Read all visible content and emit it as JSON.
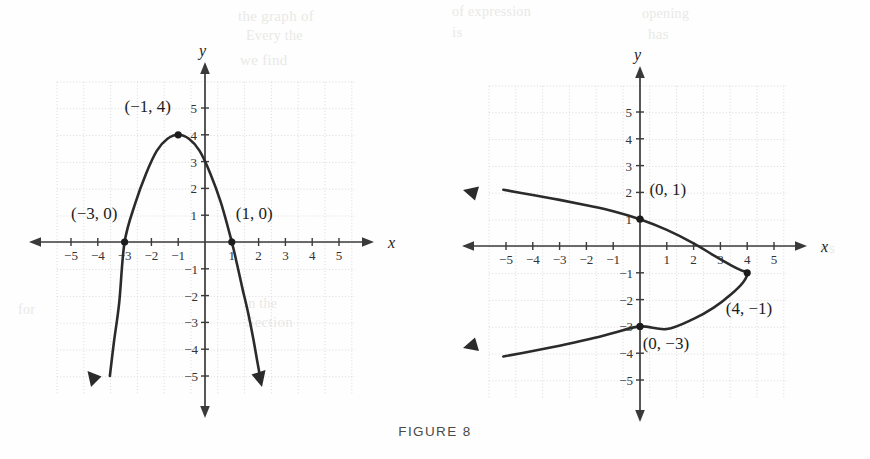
{
  "caption": "FIGURE 8",
  "ghost_text": [
    {
      "text": "the graph of",
      "x": 238,
      "y": 8
    },
    {
      "text": "Every the",
      "x": 246,
      "y": 28
    },
    {
      "text": "we find",
      "x": 240,
      "y": 52
    },
    {
      "text": "in the",
      "x": 244,
      "y": 296
    },
    {
      "text": "Section",
      "x": 246,
      "y": 314
    },
    {
      "text": "of expression",
      "x": 452,
      "y": 4
    },
    {
      "text": "is",
      "x": 452,
      "y": 24
    },
    {
      "text": "opening",
      "x": 642,
      "y": 6
    },
    {
      "text": "has",
      "x": 648,
      "y": 26
    },
    {
      "text": "for",
      "x": 18,
      "y": 302
    },
    {
      "text": "its",
      "x": 820,
      "y": 240
    }
  ],
  "axis_label_x": "x",
  "axis_label_y": "y",
  "colors": {
    "curve": "#2b2b2b",
    "axis": "#3a3a3a",
    "grid": "#d9d9d9",
    "tick_text": "#333333",
    "point": "#1c1c1c",
    "caption": "#4a4a4a",
    "background": "#fefefe"
  },
  "chart_data": [
    {
      "type": "line",
      "name": "left-parabola",
      "title": "",
      "xlabel": "x",
      "ylabel": "y",
      "xlim": [
        -6,
        6
      ],
      "ylim": [
        -6,
        6
      ],
      "xticks": [
        -5,
        -4,
        -3,
        -2,
        -1,
        1,
        2,
        3,
        4,
        5
      ],
      "xtick_labels": [
        "−5",
        "−4",
        "−3",
        "−2",
        "−1",
        "1",
        "2",
        "3",
        "4",
        "5"
      ],
      "yticks": [
        5,
        4,
        3,
        2,
        1,
        -1,
        -2,
        -3,
        -4,
        -5
      ],
      "ytick_labels": [
        "5",
        "4",
        "3",
        "2",
        "1",
        "−1",
        "−2",
        "−3",
        "−4",
        "−5"
      ],
      "grid": true,
      "legend": "none",
      "equation": "y = -(x+1)^2 + 4",
      "orientation": "opens-down",
      "vertex": [
        -1,
        4
      ],
      "x_intercepts": [
        [
          -3,
          0
        ],
        [
          1,
          0
        ]
      ],
      "annotations": [
        {
          "label": "(−1, 4)",
          "point": [
            -1,
            4
          ],
          "label_x": -3.0,
          "label_y": 4.85
        },
        {
          "label": "(−3, 0)",
          "point": [
            -3,
            0
          ],
          "label_x": -5.0,
          "label_y": 0.85
        },
        {
          "label": "(1, 0)",
          "point": [
            1,
            0
          ],
          "label_x": 1.15,
          "label_y": 0.85
        }
      ],
      "curve_points": [
        [
          -3.55,
          -5.0
        ],
        [
          -3.4,
          -3.75
        ],
        [
          -3.2,
          -2.25
        ],
        [
          -3.0,
          0.0
        ],
        [
          -2.6,
          1.45
        ],
        [
          -2.2,
          2.55
        ],
        [
          -1.8,
          3.4
        ],
        [
          -1.4,
          3.85
        ],
        [
          -1.0,
          4.0
        ],
        [
          -0.6,
          3.85
        ],
        [
          -0.2,
          3.4
        ],
        [
          0.2,
          2.55
        ],
        [
          0.6,
          1.45
        ],
        [
          1.0,
          0.0
        ],
        [
          1.2,
          -0.85
        ],
        [
          1.4,
          -1.75
        ],
        [
          1.6,
          -2.6
        ],
        [
          1.8,
          -3.6
        ],
        [
          1.95,
          -4.45
        ],
        [
          2.05,
          -5.0
        ]
      ]
    },
    {
      "type": "line",
      "name": "right-parabola",
      "title": "",
      "xlabel": "x",
      "ylabel": "y",
      "xlim": [
        -6,
        6
      ],
      "ylim": [
        -6,
        6
      ],
      "xticks": [
        -5,
        -4,
        -3,
        -2,
        -1,
        1,
        2,
        3,
        4,
        5
      ],
      "xtick_labels": [
        "−5",
        "−4",
        "−3",
        "−2",
        "−1",
        "1",
        "2",
        "3",
        "4",
        "5"
      ],
      "yticks": [
        5,
        4,
        3,
        2,
        1,
        -1,
        -2,
        -3,
        -4,
        -5
      ],
      "ytick_labels": [
        "5",
        "4",
        "3",
        "2",
        "1",
        "−1",
        "−2",
        "−3",
        "−4",
        "−5"
      ],
      "grid": true,
      "legend": "none",
      "equation": "x = -(y+1)^2 + 4",
      "orientation": "opens-left",
      "vertex": [
        4,
        -1
      ],
      "y_intercepts": [
        [
          0,
          1
        ],
        [
          0,
          -3
        ]
      ],
      "annotations": [
        {
          "label": "(0, 1)",
          "point": [
            0,
            1
          ],
          "label_x": 0.35,
          "label_y": 1.9
        },
        {
          "label": "(4, −1)",
          "point": [
            4,
            -1
          ],
          "label_x": 3.2,
          "label_y": -2.55
        },
        {
          "label": "(0, −3)",
          "point": [
            0,
            -3
          ],
          "label_x": 0.1,
          "label_y": -3.85
        }
      ],
      "curve_points": [
        [
          -5.1,
          2.1
        ],
        [
          -4.0,
          1.9
        ],
        [
          -3.0,
          1.72
        ],
        [
          -2.0,
          1.52
        ],
        [
          -1.0,
          1.3
        ],
        [
          0.0,
          1.0
        ],
        [
          1.0,
          0.6
        ],
        [
          2.0,
          0.1
        ],
        [
          2.75,
          -0.35
        ],
        [
          3.4,
          -0.72
        ],
        [
          3.8,
          -0.92
        ],
        [
          4.0,
          -1.0
        ],
        [
          3.85,
          -1.35
        ],
        [
          3.4,
          -1.8
        ],
        [
          2.75,
          -2.3
        ],
        [
          2.0,
          -2.72
        ],
        [
          1.0,
          -3.1
        ],
        [
          0.0,
          -3.0
        ],
        [
          -1.0,
          -3.25
        ],
        [
          -2.0,
          -3.5
        ],
        [
          -3.0,
          -3.72
        ],
        [
          -4.0,
          -3.92
        ],
        [
          -5.1,
          -4.12
        ]
      ]
    }
  ]
}
